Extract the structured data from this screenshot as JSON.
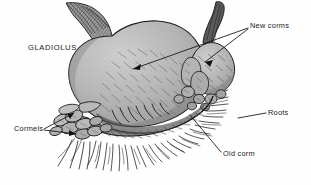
{
  "figure": {
    "subject": "GLADIOLUS",
    "background_color": "#fefefe",
    "ink_color": "#1a1a1a",
    "corm_fill_color": "#b8b8b8",
    "corm_shadow_color": "#8f8f8f",
    "corm_highlight_color": "#d2d2d2",
    "labels": {
      "gladiolus": "GLADIOLUS",
      "new_corms": "New corms",
      "roots": "Roots",
      "old_corm": "Old corm",
      "cormels": "Cormels"
    },
    "parts": [
      {
        "name": "gladiolus",
        "label": "GLADIOLUS",
        "leader": false
      },
      {
        "name": "new-corms",
        "label": "New corms",
        "leader": true,
        "leader_count": 2
      },
      {
        "name": "roots",
        "label": "Roots",
        "leader": true,
        "leader_count": 1
      },
      {
        "name": "old-corm",
        "label": "Old corm",
        "leader": true,
        "leader_count": 1
      },
      {
        "name": "cormels",
        "label": "Cormels",
        "leader": true,
        "leader_count": 2
      }
    ]
  }
}
